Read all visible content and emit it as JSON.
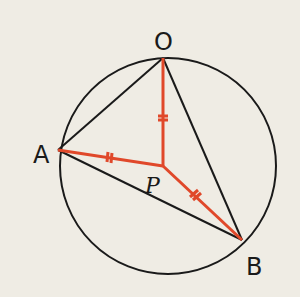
{
  "diagram": {
    "type": "geometry-circle-triangle",
    "colors": {
      "background": "#efece4",
      "black_line": "#1a1a1a",
      "red_line": "#e0482a"
    },
    "circle": {
      "cx": 168,
      "cy": 166,
      "r": 108
    },
    "points": {
      "O": {
        "label": "O",
        "x": 163,
        "y": 58
      },
      "A": {
        "label": "A",
        "x": 58,
        "y": 150
      },
      "B": {
        "label": "B",
        "x": 242,
        "y": 240
      },
      "P": {
        "label": "P",
        "x": 163,
        "y": 166
      }
    },
    "black_segments": [
      "OA",
      "OB",
      "AB"
    ],
    "red_segments": [
      "PO",
      "PA",
      "PB"
    ],
    "tick_marks": [
      "PO",
      "PA",
      "PB"
    ]
  }
}
